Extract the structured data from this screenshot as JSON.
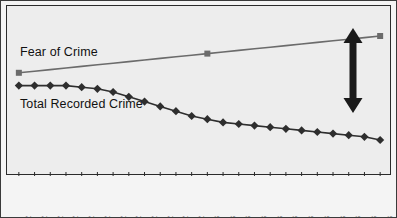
{
  "chart_data": {
    "type": "line",
    "title": "",
    "subtitle": "",
    "xlabel": "",
    "ylabel": "",
    "grid": false,
    "legend_position": "inline-annotation",
    "axis": {
      "x_range_labels": [
        "Jan-02",
        "Dec-03"
      ],
      "y_axis_visible": false,
      "y_tick_labels": []
    },
    "categories": [
      "Jan-02",
      "Feb-02",
      "Mar-02",
      "Apr-02",
      "May-02",
      "Jun-02",
      "Jul-02",
      "Aug-02",
      "Sep-02",
      "Oct-02",
      "Nov-02",
      "Dec-02",
      "Jan-03",
      "Feb-03",
      "Mar-03",
      "Apr-03",
      "May-03",
      "Jun-03",
      "Jul-03",
      "Aug-03",
      "Sep-03",
      "Oct-03",
      "Nov-03",
      "Dec-03"
    ],
    "series": [
      {
        "name": "Fear of Crime",
        "color": "#6b6b6b",
        "marker": "square",
        "marker_indices": [
          0,
          12,
          23
        ],
        "values": [
          62,
          63,
          64,
          65,
          66,
          67,
          68,
          69,
          70,
          71,
          72,
          73,
          74,
          75,
          76,
          77,
          78,
          79,
          80,
          81,
          82,
          83,
          84,
          85
        ]
      },
      {
        "name": "Total Recorded Crime",
        "color": "#2e2e2e",
        "marker": "diamond",
        "marker_indices": [
          0,
          1,
          2,
          3,
          4,
          5,
          6,
          7,
          8,
          9,
          10,
          11,
          12,
          13,
          14,
          15,
          16,
          17,
          18,
          19,
          20,
          21,
          22,
          23
        ],
        "values": [
          54,
          54,
          54,
          54,
          53,
          52,
          50,
          47,
          44,
          41,
          38,
          35,
          33,
          31,
          30,
          29,
          28,
          27,
          26,
          25,
          24,
          23,
          22,
          20
        ]
      }
    ],
    "annotations": [
      {
        "name": "gap-arrow",
        "type": "double-headed-vertical-arrow",
        "color": "#1a1a1a",
        "at_category": "Nov-03",
        "meaning": "widening gap between fear of crime and recorded crime"
      }
    ],
    "ylim": [
      0,
      100
    ]
  },
  "captions": {
    "fear_of_crime": "Fear of Crime",
    "total_recorded_crime": "Total Recorded Crime"
  }
}
